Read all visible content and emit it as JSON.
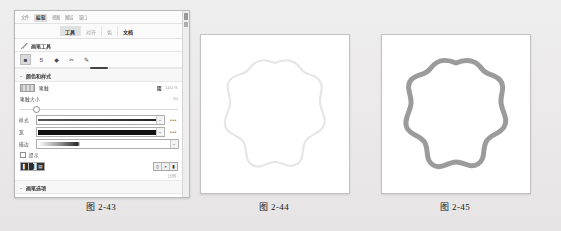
{
  "panel": {
    "menu": {
      "items": [
        {
          "label": "文件",
          "active": false
        },
        {
          "label": "编辑",
          "active": true
        },
        {
          "label": "视图",
          "active": false
        },
        {
          "label": "图层",
          "active": false
        },
        {
          "label": "窗口",
          "active": false
        }
      ]
    },
    "tabs": [
      {
        "label": "工具",
        "state": "selected"
      },
      {
        "label": "对齐",
        "state": "normal"
      },
      {
        "label": "色",
        "state": "normal"
      },
      {
        "label": "文档",
        "state": "strong"
      }
    ],
    "tool_title": {
      "icon": "brush-icon",
      "label": "画笔工具"
    },
    "tool_icons": [
      {
        "name": "square-tool-icon",
        "glyph": "■",
        "selected": true
      },
      {
        "name": "number-tool-icon",
        "glyph": "5",
        "selected": false
      },
      {
        "name": "fill-tool-icon",
        "glyph": "◆",
        "selected": false
      },
      {
        "name": "scissors-tool-icon",
        "glyph": "✂",
        "selected": false
      },
      {
        "name": "pen-tool-icon",
        "glyph": "✎",
        "selected": false
      }
    ],
    "section_color": {
      "chevron": "⌄",
      "title": "颜色和样式"
    },
    "stroke_row": {
      "swatch_name": "stroke-color-swatch",
      "label": "笔触",
      "opacity_label": "阻",
      "opacity_value": "100 %"
    },
    "stroke_size": {
      "label": "笔触大小",
      "value": "20",
      "knob_percent": 8
    },
    "style_row": {
      "label": "样式",
      "preview": "thin-line-preview",
      "more": "•••"
    },
    "width_row": {
      "label": "宽",
      "preview": "thick-line-preview",
      "more": "•••"
    },
    "outline_row": {
      "label": "描边",
      "preview": "taper-line-preview"
    },
    "hint_row": {
      "checkbox_name": "hint-checkbox",
      "label": "提示",
      "checked": false
    },
    "align_buttons": [
      {
        "name": "align-left-button",
        "glyph": "▌"
      },
      {
        "name": "align-center-button",
        "glyph": "▐"
      },
      {
        "name": "align-right-button",
        "glyph": "▤"
      }
    ],
    "cap_buttons": [
      {
        "name": "cap-butt-button",
        "glyph": "▯"
      },
      {
        "name": "cap-round-button",
        "glyph": "◗"
      },
      {
        "name": "cap-square-button",
        "glyph": "▮"
      }
    ],
    "quality_label": "比例  :",
    "section_brush": {
      "chevron": "⌄",
      "title": "画笔选项"
    },
    "smooth_row": {
      "label": "平滑",
      "value": "50",
      "knob_percent": 92
    }
  },
  "canvases": [
    {
      "name": "canvas-mid",
      "stroke_color": "#e4e4e4",
      "stroke_width": 2.2,
      "description": "light-wavy-blob-outline"
    },
    {
      "name": "canvas-right",
      "stroke_color": "#9b9b9b",
      "stroke_width": 5.0,
      "description": "gray-wavy-blob-outline"
    }
  ],
  "captions": {
    "figure_1": "图 2-43",
    "figure_2": "图 2-44",
    "figure_3": "图 2-45"
  }
}
